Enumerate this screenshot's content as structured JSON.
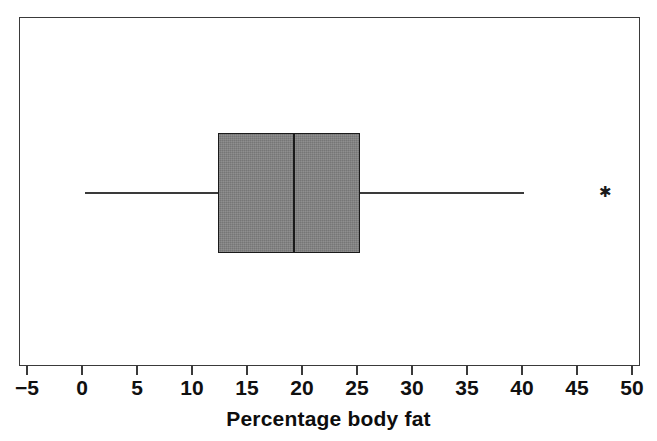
{
  "chart_data": {
    "type": "box",
    "title": "",
    "xlabel": "Percentage body fat",
    "ylabel": "",
    "orientation": "horizontal",
    "xlim": [
      -5,
      50
    ],
    "grid": false,
    "legend": null,
    "xticks": [
      -5,
      0,
      5,
      10,
      15,
      20,
      25,
      30,
      35,
      40,
      45,
      50
    ],
    "xtick_labels": [
      "−5",
      "0",
      "5",
      "10",
      "15",
      "20",
      "25",
      "30",
      "35",
      "40",
      "45",
      "50"
    ],
    "boxes": [
      {
        "name": "Percentage body fat",
        "whisker_low": 0.3,
        "q1": 12.4,
        "median": 19.3,
        "q3": 25.3,
        "whisker_high": 40.2,
        "outliers": [
          47.5
        ],
        "box_fill": "#838383",
        "line_color": "#1a1a1a",
        "outlier_marker": "asterisk"
      }
    ],
    "axes": {
      "frame": true,
      "frame_color": "#3a3a3a",
      "background": "#ffffff"
    }
  },
  "figure": {
    "background": "#ffffff",
    "outlier_glyph": "✱"
  }
}
